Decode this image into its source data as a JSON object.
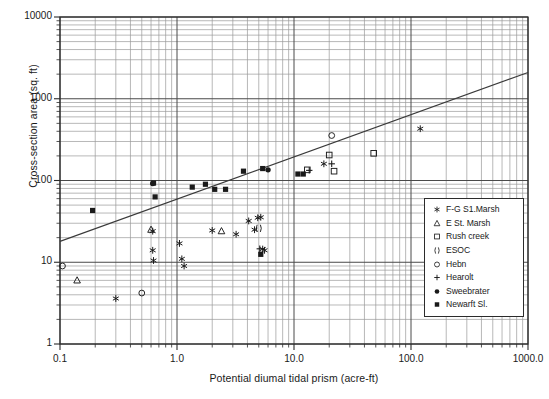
{
  "chart_data": {
    "type": "scatter",
    "title": "",
    "xlabel": "Potential diumal tidal prism (acre-ft)",
    "ylabel": "Cross-section area (sq. ft)",
    "xscale": "log",
    "yscale": "log",
    "xlim": [
      0.1,
      1000.0
    ],
    "ylim": [
      1,
      10000
    ],
    "xticks": [
      "0.1",
      "1.0",
      "10.0",
      "100.0",
      "1000.0"
    ],
    "xtick_values": [
      0.1,
      1.0,
      10.0,
      100.0,
      1000.0
    ],
    "yticks": [
      "1",
      "10",
      "100",
      "1000",
      "10000"
    ],
    "ytick_values": [
      1,
      10,
      100,
      1000,
      10000
    ],
    "grid": "log-minor-both-axes",
    "legend_position": "bottom-right-inside",
    "trendline": {
      "x": [
        0.1,
        1000.0
      ],
      "y": [
        18.0,
        2100.0
      ],
      "style": "solid"
    },
    "series": [
      {
        "name": "F-G S1.Marsh",
        "marker": "asterisk",
        "color": "#1a1a1a",
        "points": [
          {
            "x": 0.3,
            "y": 3.6
          },
          {
            "x": 0.62,
            "y": 24.0
          },
          {
            "x": 0.62,
            "y": 14.0
          },
          {
            "x": 0.63,
            "y": 10.5
          },
          {
            "x": 1.05,
            "y": 17.0
          },
          {
            "x": 1.1,
            "y": 11.0
          },
          {
            "x": 1.15,
            "y": 9.0
          },
          {
            "x": 2.0,
            "y": 24.5
          },
          {
            "x": 3.2,
            "y": 22.0
          },
          {
            "x": 4.1,
            "y": 32.0
          },
          {
            "x": 4.6,
            "y": 25.0
          },
          {
            "x": 4.9,
            "y": 35.0
          },
          {
            "x": 5.2,
            "y": 35.5
          },
          {
            "x": 5.4,
            "y": 14.5
          },
          {
            "x": 5.6,
            "y": 14.0
          },
          {
            "x": 18.0,
            "y": 160.0
          },
          {
            "x": 120.0,
            "y": 430.0
          }
        ]
      },
      {
        "name": "E St. Marsh",
        "marker": "triangle-open",
        "color": "#1a1a1a",
        "points": [
          {
            "x": 0.14,
            "y": 6.0
          },
          {
            "x": 0.6,
            "y": 25.0
          },
          {
            "x": 2.4,
            "y": 24.0
          }
        ]
      },
      {
        "name": "Rush creek",
        "marker": "square-open",
        "color": "#1a1a1a",
        "points": [
          {
            "x": 13.0,
            "y": 135.0
          },
          {
            "x": 20.0,
            "y": 205.0
          },
          {
            "x": 22.0,
            "y": 130.0
          },
          {
            "x": 48.0,
            "y": 215.0
          }
        ]
      },
      {
        "name": "ESOC",
        "marker": "parens",
        "color": "#1a1a1a",
        "points": [
          {
            "x": 5.0,
            "y": 26.0
          }
        ]
      },
      {
        "name": "Hebn",
        "marker": "circle-open",
        "color": "#1a1a1a",
        "points": [
          {
            "x": 0.105,
            "y": 9.0
          },
          {
            "x": 0.5,
            "y": 4.2
          },
          {
            "x": 21.0,
            "y": 355.0
          }
        ]
      },
      {
        "name": "Hearolt",
        "marker": "plus",
        "color": "#1a1a1a",
        "points": [
          {
            "x": 5.1,
            "y": 14.6
          },
          {
            "x": 13.5,
            "y": 133.0
          },
          {
            "x": 21.0,
            "y": 160.0
          }
        ]
      },
      {
        "name": "Sweebrater",
        "marker": "circle-filled",
        "color": "#1a1a1a",
        "points": [
          {
            "x": 0.62,
            "y": 92.0
          },
          {
            "x": 6.0,
            "y": 135.0
          }
        ]
      },
      {
        "name": "Newarft Sl.",
        "marker": "square-filled",
        "color": "#1a1a1a",
        "points": [
          {
            "x": 0.19,
            "y": 43.0
          },
          {
            "x": 0.63,
            "y": 93.0
          },
          {
            "x": 0.65,
            "y": 63.0
          },
          {
            "x": 1.35,
            "y": 83.0
          },
          {
            "x": 1.75,
            "y": 90.0
          },
          {
            "x": 2.1,
            "y": 78.0
          },
          {
            "x": 2.6,
            "y": 78.0
          },
          {
            "x": 3.7,
            "y": 130.0
          },
          {
            "x": 5.2,
            "y": 12.5
          },
          {
            "x": 5.4,
            "y": 140.0
          },
          {
            "x": 10.8,
            "y": 120.0
          },
          {
            "x": 12.0,
            "y": 120.0
          }
        ]
      }
    ]
  },
  "legend": {
    "items": [
      {
        "label": "F-G S1.Marsh",
        "marker": "asterisk"
      },
      {
        "label": "E St. Marsh",
        "marker": "triangle-open"
      },
      {
        "label": "Rush creek",
        "marker": "square-open"
      },
      {
        "label": "ESOC",
        "marker": "parens"
      },
      {
        "label": "Hebn",
        "marker": "circle-open"
      },
      {
        "label": "Hearolt",
        "marker": "plus"
      },
      {
        "label": "Sweebrater",
        "marker": "circle-filled"
      },
      {
        "label": "Newarft Sl.",
        "marker": "square-filled"
      }
    ]
  },
  "colors": {
    "axis": "#2b2b2b",
    "grid_major": "#4a4a4a",
    "grid_minor": "#9a9a9a",
    "marker": "#1a1a1a",
    "trendline": "#3a3a3a",
    "background": "#ffffff"
  }
}
